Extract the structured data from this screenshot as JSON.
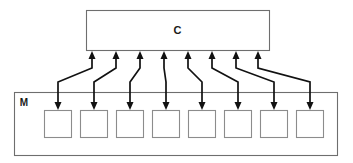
{
  "diagram": {
    "type": "block-connector-diagram",
    "canvas": {
      "width": 353,
      "height": 163,
      "background": "#ffffff"
    },
    "style": {
      "frame_stroke": "#6e6e6e",
      "cell_stroke": "#8c8c8c",
      "connector_stroke": "#111111",
      "label_color": "#1a1a1a"
    },
    "nodes": {
      "controller": {
        "label": "C",
        "shape": "rectangle",
        "x": 86,
        "y": 10,
        "width": 183,
        "height": 40
      },
      "memory": {
        "label": "M",
        "shape": "rectangle",
        "x": 14,
        "y": 92,
        "width": 323,
        "height": 63,
        "label_x": 24,
        "label_y": 106
      }
    },
    "memory_cells": {
      "count": 8,
      "width": 27,
      "height": 27,
      "y": 110,
      "x_positions": [
        44,
        80,
        116,
        152,
        188,
        224,
        260,
        296
      ]
    },
    "connectors": {
      "count": 8,
      "description": "Each connector is an S-shaped link: an arrow pointing up into C and an arrow pointing down into a memory cell, joined by a diagonal segment.",
      "up_arrow_x": [
        92,
        116,
        140,
        164,
        188,
        212,
        236,
        258
      ],
      "down_arrow_x": [
        58,
        94,
        130,
        166,
        202,
        238,
        274,
        310
      ],
      "up_arrow_tip_y": 51,
      "down_arrow_tip_y": 110,
      "diagonal_top_y": 68,
      "diagonal_bottom_y": 82,
      "arrow_head_width": 7,
      "arrow_head_length": 8
    }
  }
}
